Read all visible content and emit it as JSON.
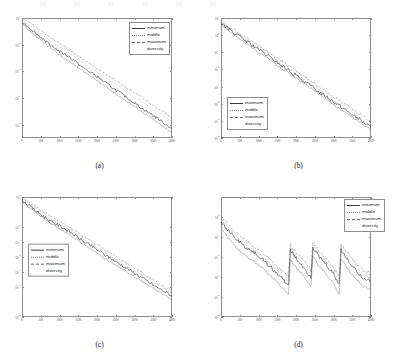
{
  "figure": {
    "panels": [
      {
        "id": "a",
        "caption": "(a)",
        "legend_position": "top-right",
        "legend": [
          {
            "label": "minimum",
            "style": "solid"
          },
          {
            "label": "middle",
            "style": "dotted"
          },
          {
            "label": "maximum",
            "style": "dashdot"
          },
          {
            "label": "diversity",
            "style": "solid"
          }
        ],
        "chart_data": {
          "type": "line",
          "title": "",
          "xlabel": "",
          "ylabel": "",
          "xlim": [
            0,
            4000
          ],
          "ylim": [
            1e-09,
            1
          ],
          "yscale": "log",
          "grid": false,
          "legend": "top-right",
          "xticks": [
            0,
            500,
            1000,
            1500,
            2000,
            2500,
            3000,
            3500,
            4000
          ],
          "yticks": [
            "10^0",
            "10^-2",
            "10^-4",
            "10^-6",
            "10^-8"
          ],
          "x": [
            0,
            200,
            400,
            600,
            800,
            1000,
            1200,
            1400,
            1600,
            1800,
            2000,
            2200,
            2400,
            2600,
            2800,
            3000,
            3200,
            3400,
            3600,
            3800,
            4000
          ],
          "series": [
            {
              "name": "minimum",
              "style": "solid",
              "values": [
                0.5,
                0.18,
                0.06,
                0.02,
                0.008,
                0.003,
                0.0015,
                0.0006,
                0.0002,
                9e-05,
                4e-05,
                1.5e-05,
                6e-06,
                2.5e-06,
                1e-06,
                4e-07,
                1.6e-07,
                7e-08,
                3e-08,
                1.2e-08,
                5e-09
              ]
            },
            {
              "name": "middle",
              "style": "dotted",
              "values": [
                0.7,
                0.3,
                0.11,
                0.04,
                0.016,
                0.007,
                0.003,
                0.0013,
                0.0005,
                0.0002,
                9e-05,
                4e-05,
                1.6e-05,
                7e-06,
                3e-06,
                1.2e-06,
                5e-07,
                2.2e-07,
                9e-08,
                4e-08,
                1.6e-08
              ]
            },
            {
              "name": "maximum",
              "style": "dashdot",
              "values": [
                0.9,
                0.45,
                0.17,
                0.07,
                0.028,
                0.012,
                0.005,
                0.0022,
                0.0009,
                0.0004,
                0.00017,
                7e-05,
                3e-05,
                1.3e-05,
                5.5e-06,
                2.3e-06,
                1e-06,
                4.2e-07,
                1.8e-07,
                8e-08,
                3.2e-08
              ]
            },
            {
              "name": "diversity",
              "style": "solid",
              "values": [
                0.35,
                0.1,
                0.035,
                0.012,
                0.0045,
                0.0017,
                0.0007,
                0.0003,
                0.00011,
                5e-05,
                2e-05,
                8e-06,
                3.2e-06,
                1.3e-06,
                5.5e-07,
                2.2e-07,
                9e-08,
                3.8e-08,
                1.5e-08,
                6e-09,
                2.4e-09
              ]
            }
          ]
        }
      },
      {
        "id": "b",
        "caption": "(b)",
        "legend_position": "bottom-left",
        "legend": [
          {
            "label": "minimum",
            "style": "solid"
          },
          {
            "label": "middle",
            "style": "dotted"
          },
          {
            "label": "maximum",
            "style": "dashdot"
          },
          {
            "label": "diversity",
            "style": "solid"
          }
        ],
        "chart_data": {
          "type": "line",
          "title": "",
          "xlabel": "",
          "ylabel": "",
          "xlim": [
            0,
            4000
          ],
          "ylim": [
            1e-06,
            10
          ],
          "yscale": "log",
          "grid": false,
          "legend": "bottom-left",
          "xticks": [
            0,
            500,
            1000,
            1500,
            2000,
            2500,
            3000,
            3500,
            4000
          ],
          "yticks": [
            "10^1",
            "10^0",
            "10^-1",
            "10^-2",
            "10^-3",
            "10^-4",
            "10^-5",
            "10^-6"
          ],
          "x": [
            0,
            200,
            400,
            600,
            800,
            1000,
            1200,
            1400,
            1600,
            1800,
            2000,
            2200,
            2400,
            2600,
            2800,
            3000,
            3200,
            3400,
            3600,
            3800,
            4000
          ],
          "series": [
            {
              "name": "minimum",
              "style": "solid",
              "values": [
                5,
                2.2,
                1.1,
                0.55,
                0.28,
                0.14,
                0.07,
                0.035,
                0.017,
                0.0085,
                0.0042,
                0.0021,
                0.001,
                0.0005,
                0.00026,
                0.00013,
                6.5e-05,
                3.2e-05,
                1.6e-05,
                8e-06,
                4e-06
              ]
            },
            {
              "name": "middle",
              "style": "dotted",
              "values": [
                5.5,
                2.6,
                1.3,
                0.68,
                0.34,
                0.17,
                0.086,
                0.043,
                0.021,
                0.011,
                0.0053,
                0.0026,
                0.0013,
                0.00066,
                0.00033,
                0.00016,
                8e-05,
                4e-05,
                2e-05,
                1e-05,
                5e-06
              ]
            },
            {
              "name": "maximum",
              "style": "dashdot",
              "values": [
                6,
                3.1,
                1.7,
                0.9,
                0.46,
                0.24,
                0.12,
                0.062,
                0.031,
                0.016,
                0.008,
                0.004,
                0.002,
                0.001,
                0.0005,
                0.00026,
                0.00013,
                6.6e-05,
                3.3e-05,
                1.7e-05,
                8.5e-06
              ]
            },
            {
              "name": "diversity",
              "style": "solid",
              "values": [
                4.2,
                1.8,
                0.85,
                0.42,
                0.2,
                0.1,
                0.05,
                0.025,
                0.012,
                0.006,
                0.003,
                0.0015,
                0.00074,
                0.00037,
                0.00018,
                9e-05,
                4.5e-05,
                2.3e-05,
                1.15e-05,
                5.8e-06,
                2.9e-06
              ]
            }
          ]
        }
      },
      {
        "id": "c",
        "caption": "(c)",
        "legend_position": "mid-left",
        "legend": [
          {
            "label": "minimum",
            "style": "solid"
          },
          {
            "label": "middle",
            "style": "dotted"
          },
          {
            "label": "maximum",
            "style": "dashdot"
          },
          {
            "label": "diversity",
            "style": "solid"
          }
        ],
        "chart_data": {
          "type": "line",
          "title": "",
          "xlabel": "",
          "ylabel": "",
          "xlim": [
            0,
            4000
          ],
          "ylim": [
            1e-08,
            1
          ],
          "yscale": "log",
          "grid": false,
          "legend": "mid-left",
          "xticks": [
            0,
            500,
            1000,
            1500,
            2000,
            2500,
            3000,
            3500,
            4000
          ],
          "yticks": [
            "10^0",
            "10^-2",
            "10^-3",
            "10^-4",
            "10^-5",
            "10^-6",
            "10^-8"
          ],
          "x": [
            0,
            200,
            400,
            600,
            800,
            1000,
            1200,
            1400,
            1600,
            1800,
            2000,
            2200,
            2400,
            2600,
            2800,
            3000,
            3200,
            3400,
            3600,
            3800,
            4000
          ],
          "series": [
            {
              "name": "minimum",
              "style": "solid",
              "values": [
                0.6,
                0.25,
                0.1,
                0.045,
                0.02,
                0.012,
                0.006,
                0.0028,
                0.0012,
                0.0006,
                0.0003,
                0.00014,
                7e-05,
                3.4e-05,
                1.7e-05,
                8e-06,
                4e-06,
                1.9e-06,
                9e-07,
                5e-07,
                2.5e-07
              ]
            },
            {
              "name": "middle",
              "style": "dotted",
              "values": [
                0.75,
                0.33,
                0.15,
                0.065,
                0.03,
                0.017,
                0.0085,
                0.004,
                0.0018,
                0.0009,
                0.00044,
                0.00021,
                0.0001,
                5e-05,
                2.5e-05,
                1.2e-05,
                6e-06,
                2.9e-06,
                1.4e-06,
                7e-07,
                3.7e-07
              ]
            },
            {
              "name": "maximum",
              "style": "dashdot",
              "values": [
                0.9,
                0.42,
                0.2,
                0.09,
                0.042,
                0.024,
                0.012,
                0.0055,
                0.0026,
                0.0013,
                0.00065,
                0.0003,
                0.00015,
                7.2e-05,
                3.6e-05,
                1.8e-05,
                8.8e-06,
                4.2e-06,
                2e-06,
                1e-06,
                5.5e-07
              ]
            },
            {
              "name": "diversity",
              "style": "solid",
              "values": [
                0.5,
                0.19,
                0.075,
                0.032,
                0.014,
                0.0075,
                0.0038,
                0.0017,
                0.0008,
                0.00038,
                0.00018,
                8e-05,
                4e-05,
                2e-05,
                1e-05,
                4.7e-06,
                2.3e-06,
                1.1e-06,
                5.5e-07,
                2.8e-07,
                1.4e-07
              ]
            }
          ]
        }
      },
      {
        "id": "d",
        "caption": "(d)",
        "legend_position": "top-right",
        "legend": [
          {
            "label": "minimum",
            "style": "solid"
          },
          {
            "label": "middle",
            "style": "dotted"
          },
          {
            "label": "maximum",
            "style": "dashdot"
          },
          {
            "label": "diversity",
            "style": "solid"
          }
        ],
        "chart_data": {
          "type": "line",
          "title": "",
          "xlabel": "",
          "ylabel": "",
          "xlim": [
            0,
            4000
          ],
          "ylim": [
            1e-05,
            10
          ],
          "yscale": "log",
          "grid": false,
          "legend": "top-right",
          "note": "restart / sawtooth convergence pattern",
          "xticks": [
            0,
            500,
            1000,
            1500,
            2000,
            2500,
            3000,
            3500,
            4000
          ],
          "yticks": [
            "10^0",
            "10^-1",
            "10^-2",
            "10^-3",
            "10^-4",
            "10^-5"
          ],
          "x": [
            0,
            200,
            400,
            600,
            800,
            1000,
            1200,
            1400,
            1600,
            1800,
            1850,
            2000,
            2200,
            2400,
            2450,
            2600,
            2800,
            3000,
            3150,
            3200,
            3400,
            3600,
            3800,
            4000
          ],
          "series": [
            {
              "name": "minimum",
              "style": "solid",
              "values": [
                0.6,
                0.2,
                0.08,
                0.035,
                0.02,
                0.011,
                0.005,
                0.0022,
                0.0009,
                0.0004,
                0.02,
                0.008,
                0.003,
                0.0009,
                0.03,
                0.01,
                0.004,
                0.0013,
                0.0004,
                0.02,
                0.006,
                0.002,
                0.0009,
                0.0006
              ]
            },
            {
              "name": "middle",
              "style": "dotted",
              "values": [
                0.75,
                0.28,
                0.11,
                0.05,
                0.028,
                0.015,
                0.007,
                0.0031,
                0.0013,
                0.0006,
                0.028,
                0.011,
                0.0042,
                0.0013,
                0.04,
                0.014,
                0.0055,
                0.0018,
                0.0006,
                0.028,
                0.0085,
                0.003,
                0.0013,
                0.0009
              ]
            },
            {
              "name": "maximum",
              "style": "dashdot",
              "values": [
                0.95,
                0.4,
                0.16,
                0.075,
                0.042,
                0.023,
                0.011,
                0.005,
                0.0021,
                0.001,
                0.04,
                0.017,
                0.0065,
                0.002,
                0.06,
                0.021,
                0.008,
                0.0028,
                0.001,
                0.04,
                0.013,
                0.0046,
                0.002,
                0.0014
              ]
            },
            {
              "name": "diversity",
              "style": "solid",
              "values": [
                0.3,
                0.08,
                0.03,
                0.013,
                0.0075,
                0.004,
                0.0018,
                0.0008,
                0.00033,
                0.00014,
                0.008,
                0.003,
                0.0011,
                0.00032,
                0.012,
                0.0038,
                0.0014,
                0.00045,
                0.00014,
                0.008,
                0.0022,
                0.0008,
                0.00033,
                0.00022
              ]
            }
          ]
        }
      }
    ]
  }
}
